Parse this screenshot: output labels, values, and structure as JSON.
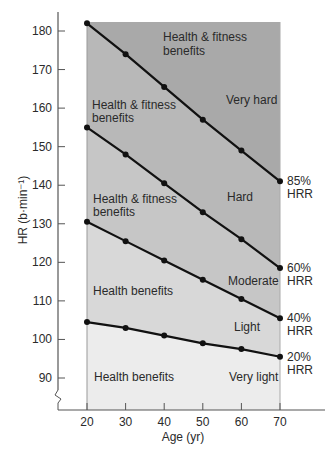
{
  "chart_data": {
    "type": "line",
    "title": "",
    "xlabel": "Age (yr)",
    "ylabel": "HR (b·min⁻¹)",
    "x": [
      20,
      30,
      40,
      50,
      60,
      70
    ],
    "xlim": [
      20,
      70
    ],
    "ylim": [
      82,
      184
    ],
    "yticks": [
      90,
      100,
      110,
      120,
      130,
      140,
      150,
      160,
      170,
      180
    ],
    "xticks": [
      20,
      30,
      40,
      50,
      60,
      70
    ],
    "grid": false,
    "legend": "inline labels at right end of each line",
    "axis_break": "y-axis break marker near bottom",
    "series": [
      {
        "name": "85% HRR",
        "label_line1": "85%",
        "label_line2": "HRR",
        "values": [
          182,
          174,
          165.5,
          157,
          149,
          141
        ]
      },
      {
        "name": "60% HRR",
        "label_line1": "60%",
        "label_line2": "HRR",
        "values": [
          155,
          148,
          140.5,
          133,
          126,
          118.5
        ]
      },
      {
        "name": "40% HRR",
        "label_line1": "40%",
        "label_line2": "HRR",
        "values": [
          130.5,
          125.5,
          120.5,
          115.5,
          110.5,
          105.5
        ]
      },
      {
        "name": "20% HRR",
        "label_line1": "20%",
        "label_line2": "HRR",
        "values": [
          104.5,
          103,
          101,
          99,
          97.5,
          95.5
        ]
      }
    ],
    "zones": [
      {
        "name": "Very hard",
        "benefit_line1": "Health & fitness",
        "benefit_line2": "benefits",
        "color": "#a9a9a9"
      },
      {
        "name": "Hard",
        "benefit_line1": "Health & fitness",
        "benefit_line2": "benefits",
        "color": "#b8b8b8"
      },
      {
        "name": "Moderate",
        "benefit_line1": "Health & fitness",
        "benefit_line2": "benefits",
        "color": "#c6c6c6"
      },
      {
        "name": "Light",
        "benefit_line1": "Health benefits",
        "benefit_line2": "",
        "color": "#d8d8d8"
      },
      {
        "name": "Very light",
        "benefit_line1": "Health benefits",
        "benefit_line2": "",
        "color": "#ececec"
      }
    ],
    "colors": {
      "line": "#111111",
      "axis": "#555555",
      "text": "#2a2a2a"
    }
  }
}
